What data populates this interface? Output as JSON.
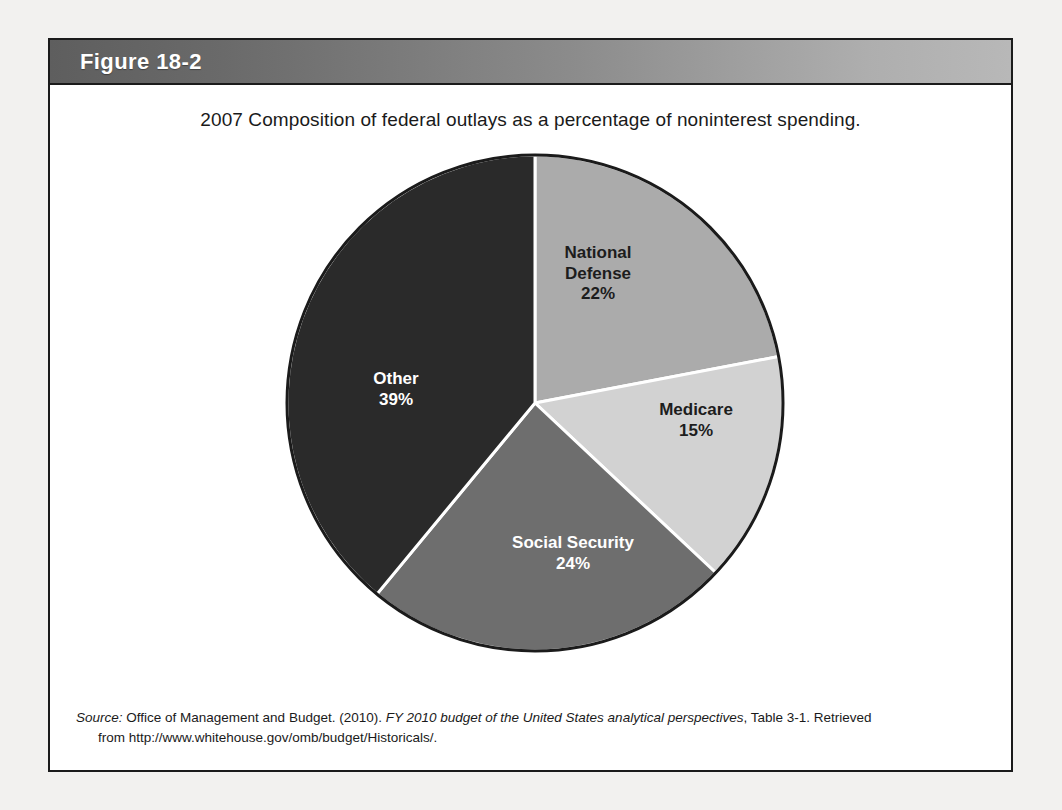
{
  "figure": {
    "number_label": "Figure 18-2",
    "caption": "2007 Composition of federal outlays as a percentage of noninterest spending."
  },
  "source": {
    "label": "Source:",
    "publisher": " Office of Management and Budget. (2010). ",
    "title": "FY 2010 budget of the United States analytical perspectives",
    "locator": ", Table 3-1. Retrieved",
    "retrieved_line": "from http://www.whitehouse.gov/omb/budget/Historicals/."
  },
  "labels": {
    "national_defense_name": "National",
    "national_defense_name2": "Defense",
    "national_defense_pct": "22%",
    "medicare_name": "Medicare",
    "medicare_pct": "15%",
    "social_security_name": "Social Security",
    "social_security_pct": "24%",
    "other_name": "Other",
    "other_pct": "39%"
  },
  "colors": {
    "national_defense": "#ababab",
    "medicare": "#d2d2d2",
    "social_security": "#6e6e6e",
    "other": "#2a2a2a",
    "outline": "#1b1b1b",
    "separator": "#ffffff",
    "header_dark": "#5e5e5e",
    "header_light": "#b8b8b8",
    "page_background": "#f2f1ef",
    "panel_background": "#ffffff"
  },
  "chart_data": {
    "type": "pie",
    "title": "2007 Composition of federal outlays as a percentage of noninterest spending.",
    "categories": [
      "National Defense",
      "Medicare",
      "Social Security",
      "Other"
    ],
    "values": [
      22,
      15,
      24,
      39
    ],
    "unit": "percent",
    "total": 100,
    "start_angle_deg": 0,
    "direction": "clockwise",
    "legend": "none",
    "labels_inside_slices": true,
    "slice_colors": [
      "#ababab",
      "#d2d2d2",
      "#6e6e6e",
      "#2a2a2a"
    ],
    "slice_label_colors": [
      "#1d1d1d",
      "#1d1d1d",
      "#ffffff",
      "#ffffff"
    ]
  }
}
